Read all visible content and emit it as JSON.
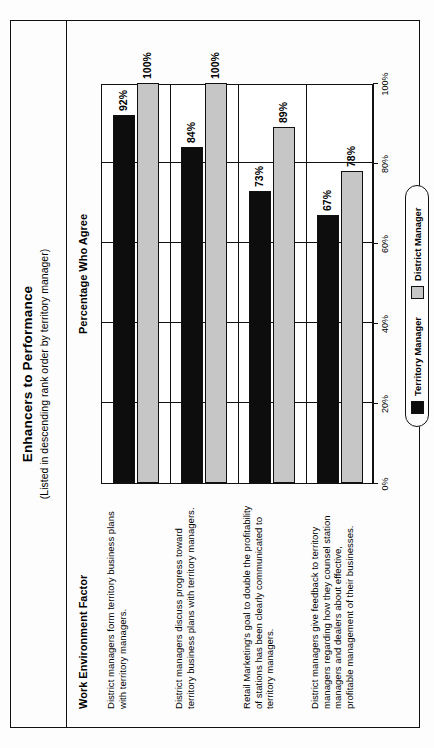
{
  "card": {
    "title": "Enhancers to Performance",
    "subtitle": "(Listed in descending rank order by territory manager)",
    "column_header_factor": "Work Environment Factor",
    "column_header_percentage": "Percentage Who Agree"
  },
  "legend": {
    "items": [
      {
        "label": "Territory Manager",
        "color": "#0d0d0d"
      },
      {
        "label": "District Manager",
        "color": "#c6c6c6"
      }
    ]
  },
  "chart_data": {
    "type": "bar",
    "orientation": "horizontal",
    "title": "Enhancers to Performance",
    "subtitle": "(Listed in descending rank order by territory manager)",
    "xlabel": "Percentage Who Agree",
    "ylabel": "Work Environment Factor",
    "xlim": [
      0,
      100
    ],
    "xticks": [
      0,
      20,
      40,
      60,
      80,
      100
    ],
    "xtick_labels": [
      "0%",
      "20%",
      "40%",
      "60%",
      "80%",
      "100%"
    ],
    "grid": true,
    "legend_position": "bottom-right",
    "categories": [
      "District managers form territory business plans with territory managers.",
      "District managers discuss progress toward territory business plans with territory managers.",
      "Retail Marketing's goal to double the profitability of stations has been clearly communicated to territory managers.",
      "District managers give feedback to territory managers regarding how they counsel station managers and dealers about effective, profitable management of their businesses."
    ],
    "series": [
      {
        "name": "Territory Manager",
        "color": "#0d0d0d",
        "values": [
          92,
          84,
          73,
          67
        ],
        "value_labels": [
          "92%",
          "84%",
          "73%",
          "67%"
        ]
      },
      {
        "name": "District Manager",
        "color": "#c6c6c6",
        "values": [
          100,
          100,
          89,
          78
        ],
        "value_labels": [
          "100%",
          "100%",
          "89%",
          "78%"
        ]
      }
    ]
  }
}
